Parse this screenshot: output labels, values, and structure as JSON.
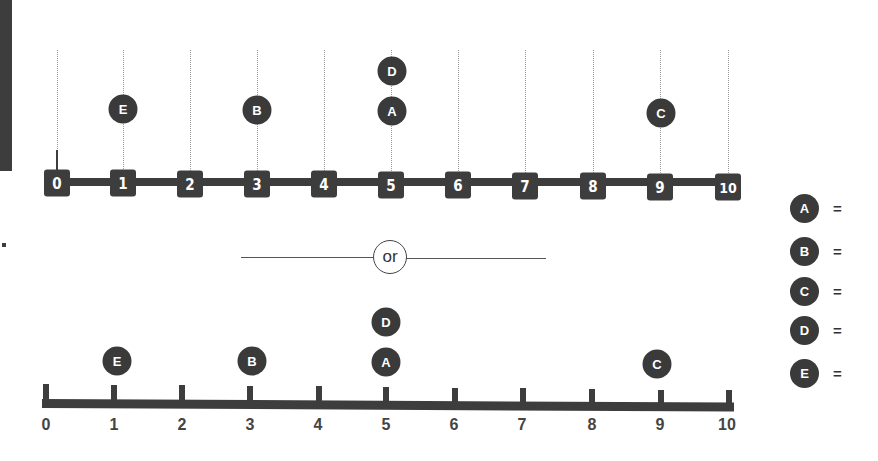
{
  "colors": {
    "dark": "#3d3d3d",
    "background": "#ffffff",
    "gridline": "#9a9a9a"
  },
  "separator": {
    "label": "or"
  },
  "top_number_line": {
    "ticks": [
      "0",
      "1",
      "2",
      "3",
      "4",
      "5",
      "6",
      "7",
      "8",
      "9",
      "10"
    ],
    "markers": [
      {
        "label": "E",
        "value": 1
      },
      {
        "label": "B",
        "value": 3
      },
      {
        "label": "A",
        "value": 5
      },
      {
        "label": "D",
        "value": 5
      },
      {
        "label": "C",
        "value": 9
      }
    ]
  },
  "bottom_number_line": {
    "ticks": [
      "0",
      "1",
      "2",
      "3",
      "4",
      "5",
      "6",
      "7",
      "8",
      "9",
      "10"
    ],
    "markers": [
      {
        "label": "E",
        "value": 1
      },
      {
        "label": "B",
        "value": 3
      },
      {
        "label": "A",
        "value": 5
      },
      {
        "label": "D",
        "value": 5
      },
      {
        "label": "C",
        "value": 9
      }
    ]
  },
  "legend": [
    {
      "label": "A",
      "equals": "="
    },
    {
      "label": "B",
      "equals": "="
    },
    {
      "label": "C",
      "equals": "="
    },
    {
      "label": "D",
      "equals": "="
    },
    {
      "label": "E",
      "equals": "="
    }
  ],
  "side_marker": "."
}
